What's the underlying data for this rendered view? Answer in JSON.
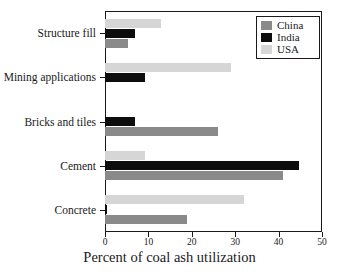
{
  "chart_data": {
    "type": "bar",
    "orientation": "horizontal",
    "title": "",
    "xlabel": "Percent of coal ash utilization",
    "ylabel": "",
    "xlim": [
      0,
      50
    ],
    "xticks": [
      0,
      10,
      20,
      30,
      40,
      50
    ],
    "xtick_labels": [
      "0",
      "10",
      "20",
      "30",
      "40",
      "50"
    ],
    "grid": false,
    "legend_position": "top-right",
    "categories": [
      "Concrete",
      "Cement",
      "Bricks and tiles",
      "Mining applications",
      "Structure fill"
    ],
    "series": [
      {
        "name": "China",
        "color": "#8a8a8a",
        "values": [
          19.0,
          41.0,
          26.0,
          0.0,
          5.3
        ]
      },
      {
        "name": "India",
        "color": "#0d0d0d",
        "values": [
          0.5,
          44.7,
          7.0,
          9.2,
          7.0
        ]
      },
      {
        "name": "USA",
        "color": "#d6d6d6",
        "values": [
          32.0,
          9.3,
          0.0,
          29.0,
          13.0
        ]
      }
    ]
  },
  "legend": {
    "entries": [
      {
        "label": "China",
        "swatch": "china"
      },
      {
        "label": "India",
        "swatch": "india"
      },
      {
        "label": "USA",
        "swatch": "usa"
      }
    ]
  },
  "colors": {
    "china": "#8a8a8a",
    "india": "#0d0d0d",
    "usa": "#d6d6d6",
    "axis": "#1a1a1a",
    "background": "#ffffff"
  }
}
